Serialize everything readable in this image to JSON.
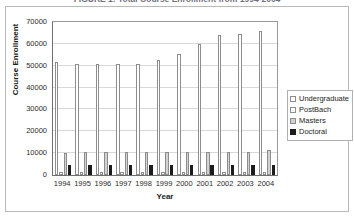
{
  "figure": {
    "title": "FIGURE 1: Total Course Enrollment from 1994-2004"
  },
  "legend": {
    "position": "right",
    "items": [
      {
        "label": "Undergraduate",
        "color": "#ffffff"
      },
      {
        "label": "PostBach",
        "color": "#ffffff"
      },
      {
        "label": "Masters",
        "color": "#d2d2d2"
      },
      {
        "label": "Doctoral",
        "color": "#1c1c1c"
      }
    ]
  },
  "axes": {
    "y_title": "Course Enrollment",
    "x_title": "Year",
    "y_ticks": [
      "0",
      "10000",
      "20000",
      "30000",
      "40000",
      "50000",
      "60000",
      "70000"
    ]
  },
  "chart_data": {
    "type": "bar",
    "title": "FIGURE 1: Total Course Enrollment from 1994-2004",
    "xlabel": "Year",
    "ylabel": "Course Enrollment",
    "ylim": [
      0,
      70000
    ],
    "ytick_step": 10000,
    "grid": true,
    "legend_position": "right",
    "categories": [
      "1994",
      "1995",
      "1996",
      "1997",
      "1998",
      "1999",
      "2000",
      "2001",
      "2002",
      "2003",
      "2004"
    ],
    "series": [
      {
        "name": "Undergraduate",
        "color": "#ffffff",
        "values": [
          51500,
          51000,
          51000,
          51000,
          51000,
          52500,
          55500,
          60000,
          64000,
          64500,
          66000
        ]
      },
      {
        "name": "PostBach",
        "color": "#ffffff",
        "values": [
          1500,
          1500,
          1500,
          1500,
          1500,
          1500,
          1500,
          1500,
          1500,
          1500,
          1500
        ]
      },
      {
        "name": "Masters",
        "color": "#d2d2d2",
        "values": [
          10000,
          10500,
          10500,
          10500,
          10500,
          10500,
          10500,
          10500,
          10500,
          10500,
          11500
        ]
      },
      {
        "name": "Doctoral",
        "color": "#1c1c1c",
        "values": [
          4500,
          4500,
          4500,
          4500,
          4500,
          4500,
          4500,
          4500,
          4500,
          4500,
          4500
        ]
      }
    ]
  }
}
